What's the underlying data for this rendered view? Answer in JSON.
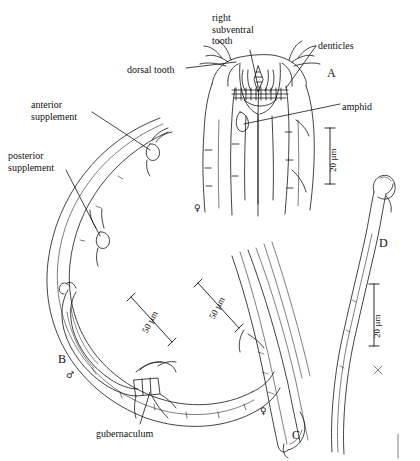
{
  "figure": {
    "type": "scientific-line-drawing-plate",
    "background": "#ffffff",
    "ink": "#111111",
    "width": 420,
    "height": 461
  },
  "labels": [
    {
      "id": "right-subventral-tooth",
      "text": "right\nsubventral\ntooth",
      "x": 212,
      "y": 12
    },
    {
      "id": "denticles",
      "text": "denticles",
      "x": 318,
      "y": 40
    },
    {
      "id": "dorsal-tooth",
      "text": "dorsal tooth",
      "x": 127,
      "y": 64
    },
    {
      "id": "amphid",
      "text": "amphid",
      "x": 342,
      "y": 101
    },
    {
      "id": "anterior-supplement",
      "text": "anterior\nsupplement",
      "x": 31,
      "y": 99
    },
    {
      "id": "posterior-supplement",
      "text": "posterior\nsupplement",
      "x": 8,
      "y": 150
    },
    {
      "id": "gubernaculum",
      "text": "gubernaculum",
      "x": 96,
      "y": 428
    }
  ],
  "panels": [
    {
      "id": "panel-a",
      "letter": "A",
      "x": 327,
      "y": 66
    },
    {
      "id": "panel-b",
      "letter": "B",
      "x": 58,
      "y": 352
    },
    {
      "id": "panel-c",
      "letter": "C",
      "x": 292,
      "y": 428
    },
    {
      "id": "panel-d",
      "letter": "D",
      "x": 379,
      "y": 236
    }
  ],
  "sex_symbols": [
    {
      "id": "panel-a-female",
      "glyph": "♀",
      "x": 194,
      "y": 203
    },
    {
      "id": "panel-b-male",
      "glyph": "♂",
      "x": 66,
      "y": 370
    },
    {
      "id": "panel-c-female",
      "glyph": "♀",
      "x": 260,
      "y": 406
    }
  ],
  "scale_bars": [
    {
      "id": "scale-a",
      "value": "20 µm",
      "panel": "A",
      "orientation": "vertical",
      "x": 322,
      "y": 126,
      "length": 56
    },
    {
      "id": "scale-b",
      "value": "50 µm",
      "panel": "B",
      "orientation": "diagonal",
      "x": 131,
      "y": 297,
      "length": 58
    },
    {
      "id": "scale-c",
      "value": "50 µm",
      "panel": "C",
      "orientation": "diagonal",
      "x": 200,
      "y": 283,
      "length": 58
    },
    {
      "id": "scale-d",
      "value": "20 µm",
      "panel": "D",
      "orientation": "vertical",
      "x": 366,
      "y": 282,
      "length": 62
    }
  ]
}
